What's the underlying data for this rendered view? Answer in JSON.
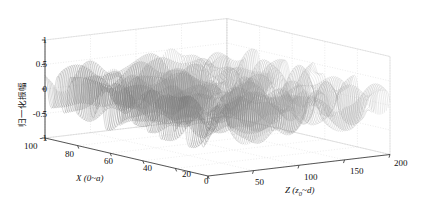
{
  "figure": {
    "background_color": "#ffffff",
    "line_color": "#808080",
    "axis_color": "#2b2b2b",
    "grid_color": "#cccccc"
  },
  "chart_data": {
    "type": "line",
    "title": "",
    "subtitle": "",
    "projection": "3d-waterfall",
    "xlabel": "X (0~a)",
    "ylabel": "归一化振幅",
    "zlabel": "Z (z₀~d)",
    "xlabel_plain": "X (0~a)",
    "zlabel_prefix": "Z (z",
    "zlabel_sub": "0",
    "zlabel_suffix": "~d)",
    "x_ticks": [
      100,
      80,
      60,
      40,
      20,
      0
    ],
    "x_tick_labels": [
      "100",
      "80",
      "60",
      "40",
      "20",
      "0"
    ],
    "xlim": [
      0,
      100
    ],
    "y_ticks": [
      1,
      0.5,
      0,
      -0.5,
      -1
    ],
    "y_tick_labels": [
      "1",
      "0.5",
      "0",
      "-0.5",
      "-1"
    ],
    "ylim": [
      -1,
      1
    ],
    "z_ticks": [
      0,
      50,
      100,
      150,
      200
    ],
    "z_tick_labels": [
      "",
      "50",
      "100",
      "150",
      "200"
    ],
    "zlim": [
      0,
      200
    ],
    "grid": true,
    "legend": "none",
    "n_traces": 101,
    "n_samples_per_trace": 220,
    "series_description": "Dense overlapping noisy oscillatory traces spanning normalized amplitude -1 to 1 across X=0..100 for each Z slice",
    "series": [
      {
        "name": "normalized-amplitude-waterfall",
        "ymin": -1,
        "ymax": 1
      }
    ]
  }
}
